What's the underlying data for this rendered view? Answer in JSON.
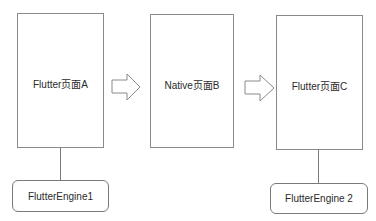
{
  "diagram": {
    "pages": [
      {
        "id": "a",
        "label": "Flutter页面A"
      },
      {
        "id": "b",
        "label": "Native页面B"
      },
      {
        "id": "c",
        "label": "Flutter页面C"
      }
    ],
    "engines": [
      {
        "id": "engine1",
        "label": "FlutterEngine1",
        "attached_to": "a"
      },
      {
        "id": "engine2",
        "label": "FlutterEngine 2",
        "attached_to": "c"
      }
    ],
    "arrows": [
      {
        "from": "a",
        "to": "b",
        "style": "hollow-block-arrow"
      },
      {
        "from": "b",
        "to": "c",
        "style": "hollow-block-arrow"
      }
    ],
    "colors": {
      "stroke": "#8a8a8a",
      "text": "#2a2a2a",
      "background": "#ffffff"
    }
  }
}
